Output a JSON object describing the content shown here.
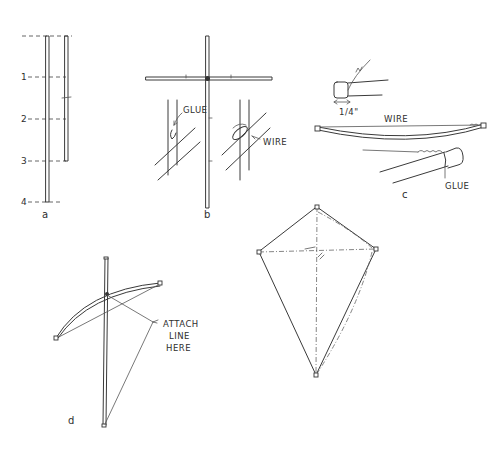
{
  "figure": {
    "type": "kite construction illustration",
    "panels": [
      {
        "id": "a",
        "caption": "a",
        "description": "Two sticks measured against a scale of four equal divisions",
        "scale_labels": [
          "1",
          "2",
          "3",
          "4"
        ]
      },
      {
        "id": "b",
        "caption": "b",
        "description": "Cross-spar joined to spine; detail views of glued and wired joints",
        "callouts": [
          "GLUE",
          "WIRE"
        ]
      },
      {
        "id": "c",
        "caption": "c",
        "description": "Bow with wire, stick-end cap detail",
        "dimension_label": "1/4\"",
        "callouts": [
          "WIRE",
          "GLUE"
        ]
      },
      {
        "id": "d",
        "caption": "d",
        "description": "Bowed frame with bridle",
        "callout": "ATTACH LINE HERE",
        "callout_lines": [
          "ATTACH",
          "LINE",
          "HERE"
        ]
      },
      {
        "id": "e",
        "caption": "",
        "description": "Completed diamond kite with dashed frame lines"
      }
    ]
  },
  "colors": {
    "ink": "#3a3a3a",
    "background": "#ffffff"
  }
}
